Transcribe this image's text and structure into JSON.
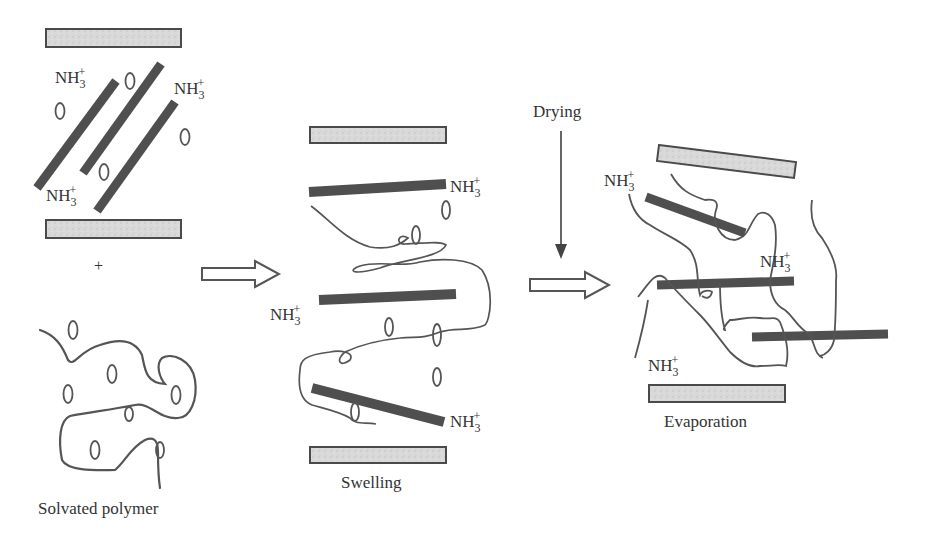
{
  "diagram": {
    "type": "process-schematic",
    "colors": {
      "clay_layer_fill": "#d6d6d6",
      "clay_layer_border": "#4a4a4a",
      "surfactant_bar": "#4f4f4f",
      "polymer_line": "#555555",
      "text": "#333333"
    },
    "species_label": {
      "base": "NH",
      "subscript": "3",
      "superscript": "+"
    },
    "plus_sign": "+",
    "stages": [
      {
        "id": "solvated-polymer",
        "caption": "Solvated polymer"
      },
      {
        "id": "swelling",
        "caption": "Swelling"
      },
      {
        "id": "evaporation",
        "caption": "Evaporation"
      }
    ],
    "arrows": [
      {
        "id": "arrow-1",
        "from": "solvated-polymer",
        "to": "swelling"
      },
      {
        "id": "arrow-2",
        "from": "swelling",
        "to": "evaporation"
      },
      {
        "id": "drying-arrow",
        "label": "Drying"
      }
    ]
  }
}
